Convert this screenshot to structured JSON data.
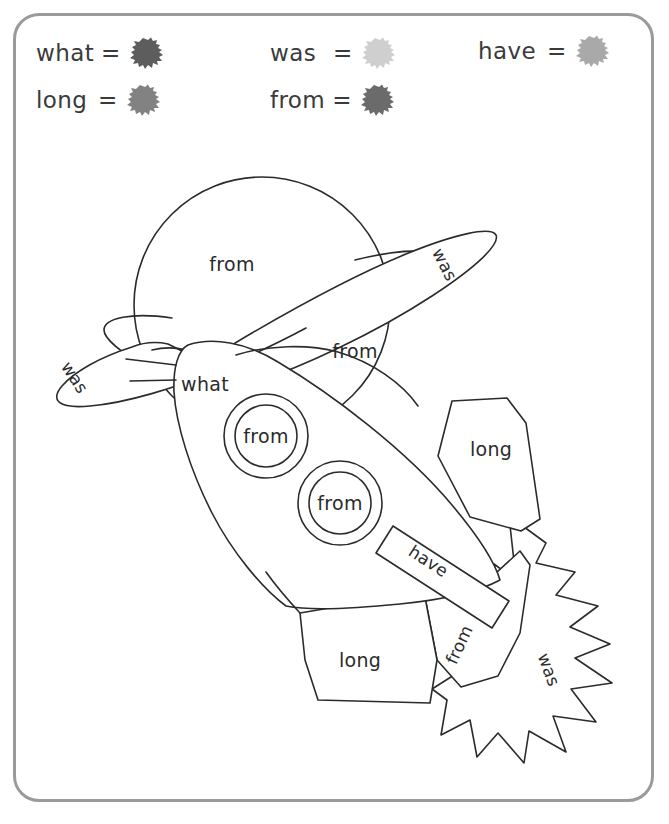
{
  "page": {
    "border_color": "#9a9a9a",
    "ink_color": "#2b2b2b",
    "background": "#ffffff"
  },
  "legend": {
    "items": [
      {
        "word": "what",
        "equals": "=",
        "color": "#5d5d5d",
        "swatch": "paint-blob"
      },
      {
        "word": "was",
        "equals": "=",
        "color": "#cfcfcf",
        "swatch": "paint-blob"
      },
      {
        "word": "have",
        "equals": "=",
        "color": "#a9a9a9",
        "swatch": "paint-blob"
      },
      {
        "word": "long",
        "equals": "=",
        "color": "#828282",
        "swatch": "paint-blob"
      },
      {
        "word": "from",
        "equals": "=",
        "color": "#6b6b6b",
        "swatch": "paint-blob"
      }
    ]
  },
  "artwork": {
    "regions": [
      {
        "id": "planet-top",
        "label": "from",
        "part": "planet-upper-body"
      },
      {
        "id": "planet-bottom",
        "label": "from",
        "part": "planet-lower-body"
      },
      {
        "id": "ring-right-tip",
        "label": "was",
        "part": "planet-ring-right"
      },
      {
        "id": "ring-left-tip",
        "label": "was",
        "part": "planet-ring-left"
      },
      {
        "id": "rocket-body",
        "label": "what",
        "part": "rocket-hull"
      },
      {
        "id": "window-upper",
        "label": "from",
        "part": "rocket-porthole-upper"
      },
      {
        "id": "window-lower",
        "label": "from",
        "part": "rocket-porthole-lower"
      },
      {
        "id": "fin-upper",
        "label": "long",
        "part": "rocket-fin-upper"
      },
      {
        "id": "fin-lower",
        "label": "long",
        "part": "rocket-fin-lower"
      },
      {
        "id": "band",
        "label": "have",
        "part": "rocket-stripe"
      },
      {
        "id": "nozzle",
        "label": "from",
        "part": "rocket-nozzle"
      },
      {
        "id": "flame",
        "label": "was",
        "part": "rocket-flame"
      }
    ]
  }
}
